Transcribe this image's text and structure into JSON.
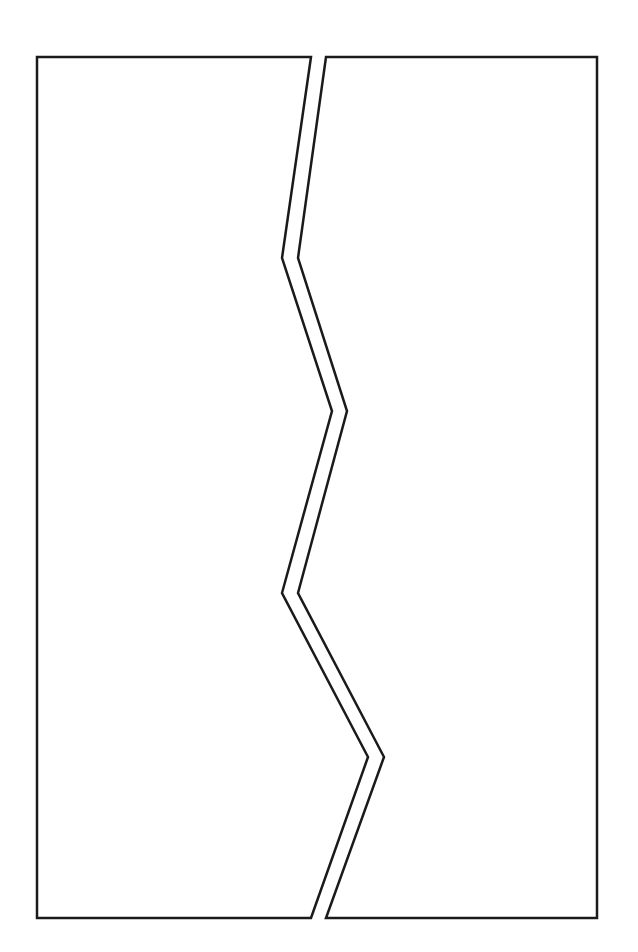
{
  "diagram": {
    "stroke_color": "#1a1a1a",
    "fill_color": "#ffffff",
    "background": "#ffffff",
    "stroke_width": 2.5,
    "pieces": [
      {
        "name": "left-piece",
        "points": [
          [
            37,
            57
          ],
          [
            311,
            57
          ],
          [
            282,
            258
          ],
          [
            332,
            411
          ],
          [
            282,
            593
          ],
          [
            368,
            757
          ],
          [
            311,
            918
          ],
          [
            37,
            918
          ]
        ]
      },
      {
        "name": "right-piece",
        "points": [
          [
            326,
            57
          ],
          [
            597,
            57
          ],
          [
            597,
            918
          ],
          [
            326,
            918
          ],
          [
            384,
            757
          ],
          [
            298,
            593
          ],
          [
            347,
            411
          ],
          [
            298,
            258
          ]
        ]
      }
    ]
  }
}
